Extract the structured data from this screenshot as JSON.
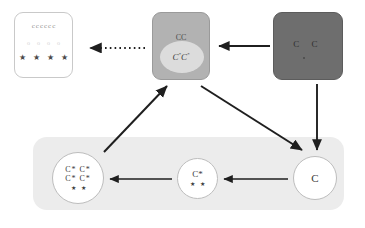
{
  "diagram": {
    "colors": {
      "panel_white_bg": "#ffffff",
      "panel_white_border": "#c9c9c9",
      "panel_gray_bg": "#b2b2b2",
      "panel_dark_bg": "#6e6e6e",
      "panel_bottom_bg": "#ececec",
      "ellipse_light": "#dcdcdc",
      "arrow": "#1f1f1f",
      "circle_border": "#bdbdbd",
      "text_dark": "#3a3a3a",
      "text_faint": "#d2d2d2",
      "glyph_gray": "#8d8d8d"
    },
    "panel_white": {
      "name": "white-panel",
      "row_c": [
        "c",
        "c",
        "c",
        "c",
        "c",
        "c"
      ],
      "row_faint": [
        "o",
        "o",
        "o",
        "o"
      ],
      "row_stars": [
        "★",
        "★",
        "★",
        "★"
      ]
    },
    "panel_gray": {
      "name": "gray-panel",
      "top_label": "CC",
      "ellipse_label_1": "C",
      "ellipse_sup_1": "*",
      "ellipse_label_2": "C",
      "ellipse_sup_2": "*"
    },
    "panel_dark": {
      "name": "dark-panel",
      "label": "C C"
    },
    "panel_bottom": {
      "name": "bottom-panel",
      "circle_left": {
        "line1": "C* C*",
        "line2": "C* C*",
        "stars": [
          "★",
          "★"
        ]
      },
      "circle_mid": {
        "line1": "C*",
        "stars": [
          "★",
          "★"
        ]
      },
      "circle_right": {
        "line1": "C"
      }
    },
    "arrows": [
      {
        "name": "arrow-dotted-gray-to-white",
        "style": "dotted",
        "direction": "left"
      },
      {
        "name": "arrow-dark-to-gray",
        "style": "solid",
        "direction": "left"
      },
      {
        "name": "arrow-circle-left-to-gray",
        "style": "solid",
        "direction": "up-right"
      },
      {
        "name": "arrow-gray-to-circle-right",
        "style": "solid",
        "direction": "down-right"
      },
      {
        "name": "arrow-dark-to-circle-right",
        "style": "solid",
        "direction": "down"
      },
      {
        "name": "arrow-circle-right-to-mid",
        "style": "solid",
        "direction": "left"
      },
      {
        "name": "arrow-circle-mid-to-left",
        "style": "solid",
        "direction": "left"
      }
    ]
  }
}
